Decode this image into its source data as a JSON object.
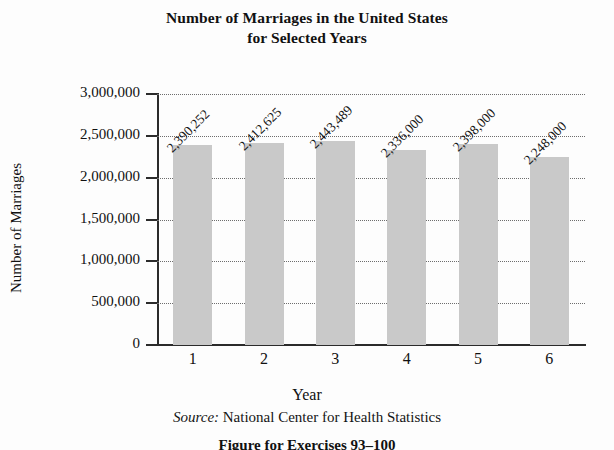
{
  "chart_data": {
    "type": "bar",
    "title": "Number of Marriages in the United States for Selected Years",
    "title_line1": "Number of Marriages in the United States",
    "title_line2": "for Selected Years",
    "xlabel": "Year",
    "ylabel": "Number of Marriages",
    "categories": [
      "1",
      "2",
      "3",
      "4",
      "5",
      "6"
    ],
    "values": [
      2390252,
      2412625,
      2443489,
      2336000,
      2398000,
      2248000
    ],
    "value_labels": [
      "2,390,252",
      "2,412,625",
      "2,443,489",
      "2,336,000",
      "2,398,000",
      "2,248,000"
    ],
    "ylim": [
      0,
      3000000
    ],
    "ytick_values": [
      0,
      500000,
      1000000,
      1500000,
      2000000,
      2500000,
      3000000
    ],
    "ytick_labels": [
      "0",
      "500,000",
      "1,000,000",
      "1,500,000",
      "2,000,000",
      "2,500,000",
      "3,000,000"
    ],
    "grid": true,
    "grid_style": "dotted",
    "legend": "none",
    "bar_color": "#c9c9c9",
    "axis_color": "#2b2b2b",
    "gridline_color": "#6d6d6d",
    "value_label_rotation": 45
  },
  "source": {
    "label": "Source:",
    "text": "National Center for Health Statistics"
  },
  "caption": {
    "text": "Figure for Exercises 93–100"
  }
}
